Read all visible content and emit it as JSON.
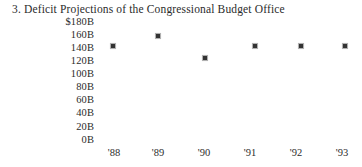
{
  "chart_data": {
    "type": "scatter",
    "title": "3. Deficit Projections of the Congressional Budget Office",
    "xlabel": "",
    "ylabel": "",
    "categories": [
      "'88",
      "'89",
      "'90",
      "'91",
      "'92",
      "'93"
    ],
    "x": [
      1988,
      1989,
      1990,
      1991,
      1992,
      1993
    ],
    "values": [
      145,
      160,
      128,
      143,
      143,
      143
    ],
    "units": "billions of dollars",
    "ylim": [
      0,
      180
    ],
    "ytick_values": [
      180,
      160,
      140,
      120,
      100,
      80,
      60,
      40,
      20,
      0
    ],
    "ytick_labels": [
      "$180B",
      "160B",
      "140B",
      "120B",
      "100B",
      "80B",
      "60B",
      "40B",
      "20B",
      "0B"
    ],
    "xtick_labels": [
      "'88",
      "'89",
      "'90",
      "'91",
      "'92",
      "'93"
    ],
    "grid": false,
    "legend": null,
    "marker": "dot",
    "marker_color": "#333333",
    "text_color": "#2b2b2b",
    "background_color": "#ffffff",
    "points": [
      {
        "label": "'88",
        "value": 145,
        "x_px": 113,
        "y_px": 46
      },
      {
        "label": "'89",
        "value": 160,
        "x_px": 158,
        "y_px": 36
      },
      {
        "label": "'90",
        "value": 128,
        "x_px": 205,
        "y_px": 58
      },
      {
        "label": "'91",
        "value": 143,
        "x_px": 255,
        "y_px": 46
      },
      {
        "label": "'92",
        "value": 143,
        "x_px": 301,
        "y_px": 46
      },
      {
        "label": "'93",
        "value": 143,
        "x_px": 345,
        "y_px": 46
      }
    ],
    "ytick_y_px": [
      21,
      34,
      47,
      60,
      73,
      86,
      99,
      112,
      126,
      139
    ],
    "xtick_x_px": [
      114,
      158,
      204,
      250,
      296,
      342
    ]
  }
}
